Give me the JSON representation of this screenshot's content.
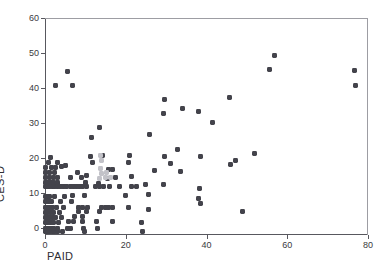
{
  "figure": {
    "background": "#ffffff",
    "marker_color": "#43434b",
    "faded_marker_color": "#c2c2c8",
    "axis_color": "#58585e"
  },
  "chart_data": {
    "type": "scatter",
    "title": "",
    "xlabel": "PAID",
    "ylabel": "CES-D",
    "xlim": [
      0,
      80
    ],
    "ylim": [
      -2,
      60
    ],
    "xticks": [
      0,
      20,
      40,
      60,
      80
    ],
    "yticks": [
      0,
      10,
      20,
      30,
      40,
      50,
      60
    ],
    "xtick_labels": [
      "0",
      "20",
      "40",
      "60",
      "80"
    ],
    "ytick_labels": [
      "0",
      "10",
      "20",
      "30",
      "40",
      "50",
      "60"
    ],
    "grid": false,
    "legend": null,
    "marker": "square",
    "series": [
      {
        "name": "observations",
        "color": "#43434b",
        "points": [
          [
            0,
            -1
          ],
          [
            0.4,
            -1
          ],
          [
            0.8,
            -1
          ],
          [
            1.2,
            -1
          ],
          [
            1.8,
            -1
          ],
          [
            2.4,
            -1
          ],
          [
            3.2,
            -1
          ],
          [
            4.4,
            -1
          ],
          [
            9.8,
            -1
          ],
          [
            24.2,
            -1
          ],
          [
            0,
            0
          ],
          [
            0.5,
            0
          ],
          [
            1.0,
            0
          ],
          [
            1.6,
            0
          ],
          [
            2.2,
            0
          ],
          [
            3.0,
            0
          ],
          [
            5.6,
            0
          ],
          [
            6.2,
            0
          ],
          [
            9.6,
            0
          ],
          [
            13.0,
            0
          ],
          [
            0,
            1.5
          ],
          [
            0.6,
            1.5
          ],
          [
            1.3,
            1.5
          ],
          [
            2.0,
            1.5
          ],
          [
            3.4,
            1.5
          ],
          [
            5.8,
            1.8
          ],
          [
            7.0,
            1.8
          ],
          [
            9.4,
            1.8
          ],
          [
            12.8,
            1.8
          ],
          [
            16.6,
            1.8
          ],
          [
            23.8,
            1.6
          ],
          [
            0,
            3
          ],
          [
            0.5,
            3
          ],
          [
            1.1,
            3
          ],
          [
            1.9,
            3
          ],
          [
            2.6,
            3
          ],
          [
            4.2,
            3
          ],
          [
            7.4,
            3.2
          ],
          [
            9.2,
            3.2
          ],
          [
            0,
            4.5
          ],
          [
            0.7,
            4.5
          ],
          [
            1.4,
            4.5
          ],
          [
            2.2,
            4.5
          ],
          [
            3.6,
            4.5
          ],
          [
            8.2,
            4.6
          ],
          [
            10.2,
            4.6
          ],
          [
            13.6,
            4.6
          ],
          [
            48.8,
            4.8
          ],
          [
            0,
            6
          ],
          [
            0.6,
            6
          ],
          [
            1.2,
            6
          ],
          [
            1.8,
            6
          ],
          [
            2.8,
            6
          ],
          [
            4.6,
            6
          ],
          [
            8.4,
            6
          ],
          [
            9.4,
            6
          ],
          [
            10.6,
            6
          ],
          [
            14.0,
            6
          ],
          [
            15.0,
            6
          ],
          [
            15.8,
            6
          ],
          [
            16.6,
            6
          ],
          [
            20.6,
            6
          ],
          [
            25.6,
            5.2
          ],
          [
            0,
            7.5
          ],
          [
            0.8,
            7.5
          ],
          [
            1.6,
            7.5
          ],
          [
            3.8,
            7.6
          ],
          [
            6.6,
            7.6
          ],
          [
            38.4,
            7
          ],
          [
            0,
            9
          ],
          [
            0.5,
            9
          ],
          [
            1.2,
            9
          ],
          [
            2.4,
            9
          ],
          [
            4.8,
            9
          ],
          [
            6.8,
            9.2
          ],
          [
            9.8,
            9.4
          ],
          [
            25.6,
            9.6
          ],
          [
            20.0,
            9.4
          ],
          [
            38.0,
            8.4
          ],
          [
            0,
            11.8
          ],
          [
            0.6,
            11.8
          ],
          [
            1.2,
            11.8
          ],
          [
            1.8,
            11.8
          ],
          [
            2.4,
            11.8
          ],
          [
            3.0,
            11.8
          ],
          [
            3.8,
            11.8
          ],
          [
            4.6,
            11.8
          ],
          [
            5.4,
            11.8
          ],
          [
            6.2,
            11.8
          ],
          [
            7.0,
            11.8
          ],
          [
            7.8,
            11.8
          ],
          [
            8.6,
            11.8
          ],
          [
            9.4,
            11.8
          ],
          [
            10.4,
            11.8
          ],
          [
            12.6,
            11.8
          ],
          [
            13.4,
            11.8
          ],
          [
            14.4,
            11.8
          ],
          [
            16.0,
            11.8
          ],
          [
            18.4,
            11.8
          ],
          [
            21.4,
            11.8
          ],
          [
            22.6,
            11.8
          ],
          [
            25.0,
            12.4
          ],
          [
            29.4,
            12.4
          ],
          [
            38.2,
            11.4
          ],
          [
            0,
            13
          ],
          [
            0.6,
            13
          ],
          [
            1.4,
            13
          ],
          [
            2.2,
            13
          ],
          [
            3.2,
            13
          ],
          [
            10.0,
            13
          ],
          [
            13.2,
            12.6
          ],
          [
            0,
            14.4
          ],
          [
            1.0,
            14.4
          ],
          [
            2.0,
            14.4
          ],
          [
            3.0,
            14.4
          ],
          [
            6.4,
            14.4
          ],
          [
            9.0,
            14.4
          ],
          [
            15.4,
            14.2
          ],
          [
            17.4,
            14.4
          ],
          [
            21.4,
            14.6
          ],
          [
            0,
            15.8
          ],
          [
            1.2,
            15.8
          ],
          [
            2.4,
            15.8
          ],
          [
            8.0,
            15.8
          ],
          [
            10.2,
            15.0
          ],
          [
            15.8,
            16.6
          ],
          [
            16.6,
            16.6
          ],
          [
            27.0,
            16.4
          ],
          [
            31.2,
            18.4
          ],
          [
            33.6,
            16.2
          ],
          [
            0,
            17.2
          ],
          [
            1.6,
            17.2
          ],
          [
            2.6,
            17.2
          ],
          [
            4.2,
            17.6
          ],
          [
            5.0,
            17.8
          ],
          [
            46.0,
            18.2
          ],
          [
            47.2,
            19.4
          ],
          [
            0.8,
            18.8
          ],
          [
            3.2,
            18.8
          ],
          [
            11.8,
            18.8
          ],
          [
            20.6,
            18.8
          ],
          [
            1.4,
            20.2
          ],
          [
            11.2,
            20.4
          ],
          [
            14.2,
            20.6
          ],
          [
            21.0,
            20.6
          ],
          [
            29.6,
            20.4
          ],
          [
            38.4,
            20.4
          ],
          [
            52.0,
            21.4
          ],
          [
            32.8,
            22.4
          ],
          [
            11.6,
            25.8
          ],
          [
            25.8,
            26.6
          ],
          [
            13.6,
            28.8
          ],
          [
            41.4,
            30.2
          ],
          [
            29.4,
            32.6
          ],
          [
            38.0,
            33.2
          ],
          [
            34.0,
            34.2
          ],
          [
            29.6,
            36.6
          ],
          [
            45.8,
            37.2
          ],
          [
            2.5,
            40.8
          ],
          [
            6.8,
            40.8
          ],
          [
            76.8,
            40.8
          ],
          [
            5.6,
            44.8
          ],
          [
            55.6,
            45.2
          ],
          [
            76.6,
            45.0
          ],
          [
            56.8,
            49.2
          ]
        ]
      },
      {
        "name": "faded-observations",
        "color": "#c2c2c8",
        "points": [
          [
            13.8,
            20.6
          ],
          [
            14.0,
            19.2
          ],
          [
            13.8,
            17.0
          ],
          [
            14.0,
            15.6
          ],
          [
            15.2,
            16.0
          ],
          [
            15.0,
            14.4
          ],
          [
            16.2,
            14.4
          ],
          [
            13.6,
            14.2
          ]
        ]
      }
    ]
  }
}
